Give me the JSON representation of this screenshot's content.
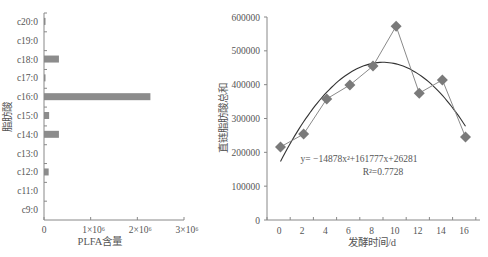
{
  "chart_data": [
    {
      "type": "bar",
      "orientation": "horizontal",
      "title": "",
      "xlabel": "PLFA含量",
      "ylabel": "脂肪酸",
      "categories": [
        "c20:0",
        "c19:0",
        "c18:0",
        "c17:0",
        "c16:0",
        "c15:0",
        "c14:0",
        "c13:0",
        "c12:0",
        "c11:0",
        "c9:0"
      ],
      "values": [
        30000,
        0,
        320000,
        30000,
        2280000,
        110000,
        320000,
        0,
        100000,
        0,
        0
      ],
      "xlim": [
        0,
        3000000
      ],
      "xticks": [
        "0",
        "1×10⁶",
        "2×10⁶",
        "3×10⁶"
      ],
      "bar_color": "#8c8c8c",
      "grid": false,
      "legend": null
    },
    {
      "type": "line",
      "title": "",
      "xlabel": "发酵时间/d",
      "ylabel": "直链脂肪酸总和",
      "x": [
        0,
        2,
        4,
        6,
        8,
        10,
        12,
        14,
        16
      ],
      "xticks": [
        "0",
        "2",
        "4",
        "6",
        "8",
        "10",
        "12",
        "14",
        "16"
      ],
      "yticks": [
        "0",
        "100000",
        "200000",
        "300000",
        "400000",
        "500000",
        "600000"
      ],
      "ylim": [
        0,
        600000
      ],
      "series": [
        {
          "name": "直链脂肪酸总和",
          "marker": "diamond",
          "color": "#7a7a7a",
          "values": [
            216000,
            254000,
            358000,
            399000,
            455000,
            573000,
            375000,
            414000,
            245000
          ]
        },
        {
          "name": "多项式趋势线",
          "kind": "trendline-poly2",
          "color": "#333333",
          "coefficients": {
            "a": -14878,
            "b": 161777,
            "c": 26281
          }
        }
      ],
      "annotations": [
        {
          "text": "y= −14878x²+161777x+26281"
        },
        {
          "text": "R²=0.7728"
        }
      ],
      "grid": false,
      "legend": null
    }
  ],
  "left": {
    "ylabel": "脂肪酸",
    "xlabel": "PLFA含量"
  },
  "right": {
    "ylabel": "直链脂肪酸总和",
    "xlabel": "发酵时间/d",
    "equation": "y= −14878x²+161777x+26281",
    "r2": "R²=0.7728"
  }
}
